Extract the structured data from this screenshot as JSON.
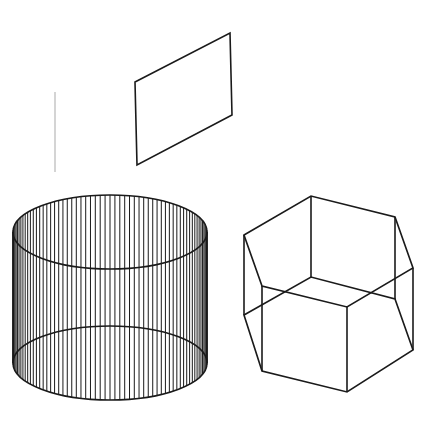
{
  "canvas": {
    "width": 440,
    "height": 426,
    "background_color": "#ffffff",
    "title": "Geometric solids line drawing"
  },
  "style": {
    "line_color": "#1a1a1a",
    "guide_line_color": "#b8b8b8",
    "fill_color": "#ffffff",
    "outline_width": 1.6,
    "ruling_width": 1.0,
    "guide_width": 1.2
  },
  "chart_data": {
    "type": "diagram",
    "subtitle": "",
    "xlabel": "",
    "ylabel": "",
    "grid": false,
    "legend": "none",
    "xlim": [
      0,
      440
    ],
    "ylim": [
      0,
      426
    ],
    "shapes": [
      {
        "name": "vertical-guide-line",
        "kind": "line",
        "color": "#b8b8b8",
        "width": 1.2,
        "points": [
          [
            55,
            92
          ],
          [
            55,
            172
          ]
        ]
      },
      {
        "name": "parallelogram-plane",
        "kind": "polygon",
        "color": "#1a1a1a",
        "width": 1.6,
        "closed": true,
        "points": [
          [
            135,
            82
          ],
          [
            230,
            33
          ],
          [
            232,
            115
          ],
          [
            137,
            165
          ]
        ]
      },
      {
        "name": "ruled-cylinder",
        "kind": "ruled-cylinder",
        "color": "#1a1a1a",
        "center_x": 110,
        "top_center_y": 232,
        "bottom_center_y": 363,
        "radius_x": 97,
        "radius_y": 37,
        "ruling_count": 62,
        "crossing_left": [
          35,
          297
        ],
        "crossing_right": [
          188,
          297
        ]
      },
      {
        "name": "hexagonal-prism",
        "kind": "wireframe-prism",
        "color": "#1a1a1a",
        "width": 1.6,
        "top_hexagon": [
          [
            244,
            235
          ],
          [
            311,
            196
          ],
          [
            395,
            217
          ],
          [
            413,
            268
          ],
          [
            347,
            307
          ],
          [
            262,
            286
          ]
        ],
        "bottom_hexagon": [
          [
            244,
            315
          ],
          [
            311,
            277
          ],
          [
            395,
            299
          ],
          [
            413,
            350
          ],
          [
            347,
            392
          ],
          [
            262,
            371
          ]
        ],
        "vertical_edges": 6
      }
    ]
  },
  "figure": {
    "guide_line": {
      "label": "vertical reference line",
      "x": 55,
      "y_top": 92,
      "y_bottom": 172
    },
    "plane": {
      "label": "parallelogram plane",
      "vertices": [
        [
          135,
          82
        ],
        [
          230,
          33
        ],
        [
          232,
          115
        ],
        [
          137,
          165
        ]
      ]
    },
    "cylinder": {
      "label": "ruled cylinder",
      "center_x": 110,
      "top_center_y": 232,
      "bottom_center_y": 363,
      "radius_x": 97,
      "radius_y": 37,
      "ruling_count": 62
    },
    "prism": {
      "label": "hexagonal prism wireframe",
      "top_hexagon": [
        [
          244,
          235
        ],
        [
          311,
          196
        ],
        [
          395,
          217
        ],
        [
          413,
          268
        ],
        [
          347,
          307
        ],
        [
          262,
          286
        ]
      ],
      "bottom_hexagon": [
        [
          244,
          315
        ],
        [
          311,
          277
        ],
        [
          395,
          299
        ],
        [
          413,
          350
        ],
        [
          347,
          392
        ],
        [
          262,
          371
        ]
      ]
    }
  }
}
